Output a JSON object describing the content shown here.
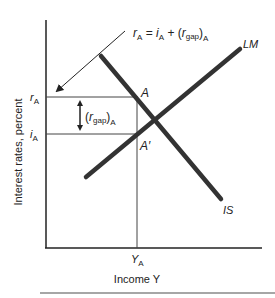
{
  "diagram": {
    "formula": {
      "r": "r",
      "r_sub": "A",
      "eq": " = ",
      "i": "i",
      "i_sub": "A",
      "plus": " + (",
      "gap_r": "r",
      "gap_sub": "gap",
      "close": ")",
      "close_sub": "A"
    },
    "gap_label": {
      "open": "(",
      "r": "r",
      "sub": "gap",
      "close": ")",
      "outer_sub": "A"
    },
    "curves": {
      "is_label": "IS",
      "lm_label": "LM"
    },
    "points": {
      "a_label": "A",
      "a_prime_label": "A′"
    },
    "axes": {
      "y_label": "Interest rates, percent",
      "x_label": "Income Y",
      "r_tick": "r",
      "r_tick_sub": "A",
      "i_tick": "i",
      "i_tick_sub": "A",
      "y_tick": "Y",
      "y_tick_sub": "A"
    },
    "colors": {
      "curve": "#333333",
      "axis": "#222222",
      "guide": "#444444",
      "rule": "#888888"
    }
  }
}
